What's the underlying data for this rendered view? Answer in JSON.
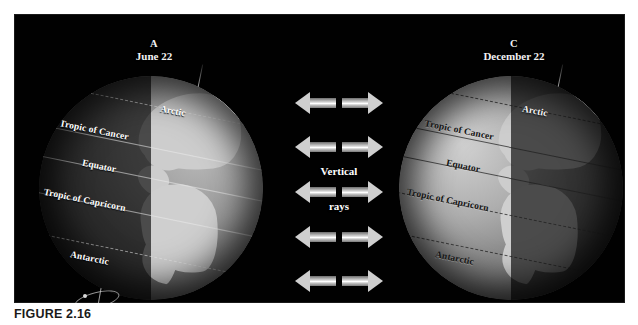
{
  "figure": {
    "caption": "FIGURE 2.16",
    "background_color": "#010101",
    "page_color": "#ffffff"
  },
  "globes": [
    {
      "id": "A",
      "letter": "A",
      "date": "June 22",
      "lit_side": "right",
      "dark_side": "left",
      "label_color": "#ffffff",
      "latitude_labels": {
        "arctic": "Arctic",
        "tropic_of_cancer": "Tropic of Cancer",
        "equator": "Equator",
        "tropic_of_capricorn": "Tropic of Capricorn",
        "antarctic": "Antarctic"
      }
    },
    {
      "id": "C",
      "letter": "C",
      "date": "December 22",
      "lit_side": "left",
      "dark_side": "right",
      "label_color": "#141414",
      "latitude_labels": {
        "arctic": "Arctic",
        "tropic_of_cancer": "Tropic of Cancer",
        "equator": "Equator",
        "tropic_of_capricorn": "Tropic of Capricorn",
        "antarctic": "Antarctic"
      }
    }
  ],
  "center_rays": {
    "label_line1": "Vertical",
    "label_line2": "rays",
    "row_count": 5,
    "arrow_color": "#cfcfcf",
    "direction": "outward-both"
  }
}
